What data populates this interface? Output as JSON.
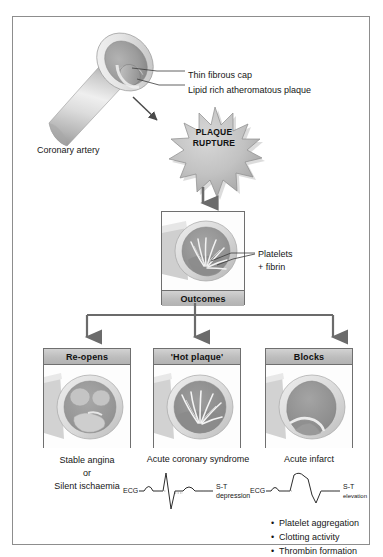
{
  "figure": {
    "title_region": "Atherosclerotic plaque rupture and clinical outcomes"
  },
  "artery": {
    "label": "Coronary artery",
    "callouts": [
      {
        "name": "thin-fibrous-cap",
        "text": "Thin fibrous cap"
      },
      {
        "name": "lipid-rich-plaque",
        "text": "Lipid rich atheromatous plaque"
      }
    ]
  },
  "rupture": {
    "line1": "PLAQUE",
    "line2": "RUPTURE"
  },
  "outcomes": {
    "header": "Outcomes",
    "callout_line1": "Platelets",
    "callout_line2": "+ fibrin"
  },
  "branches": [
    {
      "key": "reopens",
      "header": "Re-opens",
      "caption_lines": [
        "Stable angina",
        "or",
        "Silent ischaemia"
      ],
      "ecg": null,
      "bullets": []
    },
    {
      "key": "hot-plaque",
      "header": "'Hot plaque'",
      "caption_lines": [
        "Acute coronary syndrome"
      ],
      "ecg": {
        "label": "ECG",
        "finding_line1": "S-T",
        "finding_line2": "depression"
      },
      "bullets": []
    },
    {
      "key": "blocks",
      "header": "Blocks",
      "caption_lines": [
        "Acute infarct"
      ],
      "ecg": {
        "label": "ECG",
        "finding_line1": "S-T",
        "finding_line2": "elevation"
      },
      "bullets": [
        "Platelet aggregation",
        "Clotting activity",
        "Thrombin formation"
      ]
    }
  ],
  "colors": {
    "frame_border": "#8d8d8d",
    "panel_border": "#6f6f6f",
    "header_gray": "#bdbdbd",
    "vessel_wall_light": "#e2e2e2",
    "vessel_mid": "#b9b9b9",
    "lumen_dark": "#8f8f8f",
    "arrow_gray": "#777777",
    "text": "#161616"
  }
}
